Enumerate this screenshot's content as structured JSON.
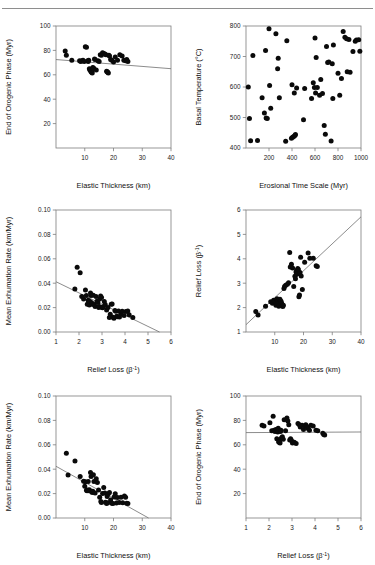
{
  "figure": {
    "title_ghost": "",
    "background": "#ffffff",
    "point_color": "#0a0a0a",
    "axis_color": "#7d7d7d",
    "trend_color": "#6e6e6e",
    "layout": "2 columns x 3 rows of scatter panels"
  },
  "chart_data": [
    {
      "id": "panel-top-left",
      "type": "scatter",
      "title": "",
      "xlabel": "Elastic Thickness (km)",
      "ylabel": "End of Orogenic Phase (Myr)",
      "xlim": [
        0,
        40
      ],
      "ylim": [
        0,
        100
      ],
      "xticks": [
        10,
        20,
        30,
        40
      ],
      "yticks": [
        20,
        40,
        60,
        80,
        100
      ],
      "grid": false,
      "legend": "none",
      "trendline": {
        "x": [
          0,
          40
        ],
        "y": [
          72.5,
          65.0
        ],
        "slope": -0.1875,
        "intercept": 72.5
      },
      "x": [
        3.2,
        3.6,
        5.5,
        8.2,
        8.6,
        9.0,
        9.4,
        9.8,
        10.2,
        10.6,
        11.0,
        11.2,
        11.4,
        11.6,
        11.8,
        12.0,
        12.2,
        12.4,
        12.6,
        12.8,
        13.0,
        13.2,
        13.4,
        13.6,
        14.0,
        14.6,
        15.0,
        15.4,
        15.8,
        16.2,
        16.6,
        17.0,
        17.4,
        17.6,
        17.8,
        18.0,
        18.2,
        18.4,
        18.6,
        19.0,
        19.4,
        20.0,
        20.6,
        21.4,
        22.2,
        23.0,
        23.6,
        24.2,
        24.6,
        25.0
      ],
      "y": [
        79.5,
        76.0,
        72.0,
        71.5,
        71.0,
        71.5,
        72.0,
        71.0,
        83.0,
        82.5,
        71.5,
        71.0,
        72.0,
        65.0,
        64.0,
        63.5,
        62.5,
        62.0,
        61.5,
        66.0,
        65.5,
        65.0,
        73.0,
        72.5,
        64.0,
        71.5,
        71.0,
        76.5,
        76.0,
        78.0,
        77.5,
        77.0,
        76.5,
        63.0,
        62.5,
        62.0,
        61.5,
        76.0,
        75.5,
        72.5,
        72.0,
        70.5,
        74.5,
        72.0,
        76.5,
        75.5,
        72.0,
        71.5,
        72.5,
        71.0
      ]
    },
    {
      "id": "panel-top-right",
      "type": "scatter",
      "title": "",
      "xlabel": "Erosional Time Scale (Myr)",
      "ylabel": "Basal Temperature (°C)",
      "xlim": [
        0,
        1000
      ],
      "ylim": [
        400,
        800
      ],
      "xticks": [
        200,
        400,
        600,
        800,
        1000
      ],
      "yticks": [
        400,
        500,
        600,
        700,
        800
      ],
      "grid": false,
      "legend": "none",
      "trendline": null,
      "x": [
        20,
        30,
        40,
        60,
        100,
        140,
        160,
        170,
        175,
        185,
        200,
        205,
        215,
        260,
        275,
        280,
        290,
        345,
        355,
        395,
        400,
        405,
        415,
        420,
        425,
        430,
        440,
        500,
        510,
        570,
        585,
        595,
        600,
        605,
        610,
        620,
        640,
        650,
        665,
        680,
        690,
        700,
        710,
        720,
        740,
        750,
        755,
        760,
        800,
        815,
        830,
        845,
        860,
        875,
        880,
        895,
        905,
        930,
        950,
        960,
        980,
        990
      ],
      "y": [
        600,
        497,
        424,
        703,
        425,
        565,
        515,
        720,
        498,
        497,
        791,
        605,
        530,
        775,
        660,
        694,
        565,
        422,
        752,
        432,
        607,
        435,
        438,
        580,
        441,
        444,
        597,
        493,
        595,
        562,
        614,
        598,
        761,
        580,
        697,
        598,
        573,
        625,
        579,
        474,
        445,
        733,
        680,
        682,
        423,
        676,
        562,
        738,
        645,
        573,
        628,
        782,
        763,
        758,
        650,
        756,
        648,
        716,
        750,
        754,
        755,
        717
      ]
    },
    {
      "id": "panel-middle-left",
      "type": "scatter",
      "title": "",
      "xlabel": "Relief Loss (β⁻¹)",
      "ylabel": "Mean Exhumation Rate (km/Myr)",
      "xlim": [
        1,
        6
      ],
      "ylim": [
        0.0,
        0.1
      ],
      "xticks": [
        1,
        2,
        3,
        4,
        5,
        6
      ],
      "yticks": [
        0.0,
        0.02,
        0.04,
        0.06,
        0.08,
        0.1
      ],
      "grid": false,
      "legend": "none",
      "trendline": {
        "x": [
          1,
          5.5
        ],
        "y": [
          0.0412,
          0.0
        ],
        "slope": -0.00916,
        "intercept": 0.0504
      },
      "x": [
        1.82,
        1.92,
        2.05,
        2.12,
        2.2,
        2.28,
        2.32,
        2.36,
        2.4,
        2.42,
        2.45,
        2.48,
        2.5,
        2.52,
        2.55,
        2.58,
        2.62,
        2.66,
        2.7,
        2.74,
        2.78,
        2.82,
        2.86,
        2.88,
        2.9,
        2.94,
        2.98,
        3.0,
        3.02,
        3.06,
        3.1,
        3.14,
        3.2,
        3.26,
        3.32,
        3.36,
        3.4,
        3.44,
        3.48,
        3.52,
        3.56,
        3.6,
        3.64,
        3.68,
        3.72,
        3.76,
        3.82,
        3.88,
        3.96,
        4.04,
        4.12,
        4.18,
        4.34
      ],
      "y": [
        0.0352,
        0.053,
        0.0485,
        0.029,
        0.027,
        0.0345,
        0.03,
        0.0228,
        0.026,
        0.024,
        0.0222,
        0.025,
        0.032,
        0.03,
        0.024,
        0.0228,
        0.0302,
        0.0225,
        0.0208,
        0.0292,
        0.0252,
        0.0242,
        0.02,
        0.021,
        0.027,
        0.0296,
        0.0282,
        0.0202,
        0.0198,
        0.0206,
        0.025,
        0.0226,
        0.018,
        0.02,
        0.0118,
        0.0146,
        0.0228,
        0.023,
        0.012,
        0.0112,
        0.0176,
        0.017,
        0.013,
        0.0126,
        0.0172,
        0.0122,
        0.0148,
        0.017,
        0.0136,
        0.0168,
        0.0172,
        0.0142,
        0.0118
      ]
    },
    {
      "id": "panel-middle-right",
      "type": "scatter",
      "title": "",
      "xlabel": "Elastic Thickness (km)",
      "ylabel": "Relief Loss (β⁻¹)",
      "xlim": [
        0,
        40
      ],
      "ylim": [
        1,
        6
      ],
      "xticks": [
        10,
        20,
        30,
        40
      ],
      "yticks": [
        1,
        2,
        3,
        4,
        5,
        6
      ],
      "grid": false,
      "legend": "none",
      "trendline": {
        "x": [
          0,
          40
        ],
        "y": [
          1.3,
          5.72
        ],
        "slope": 0.1105,
        "intercept": 1.3
      },
      "x": [
        3.4,
        4.2,
        6.8,
        8.6,
        9.2,
        9.6,
        10.0,
        10.4,
        10.6,
        10.8,
        11.0,
        11.2,
        11.4,
        11.6,
        11.8,
        12.0,
        12.2,
        12.4,
        12.6,
        12.8,
        13.0,
        13.2,
        13.4,
        13.8,
        14.4,
        14.8,
        15.2,
        15.4,
        15.8,
        16.2,
        16.6,
        17.0,
        17.2,
        17.4,
        17.6,
        17.8,
        18.0,
        18.2,
        18.4,
        18.6,
        18.8,
        19.0,
        19.2,
        19.6,
        20.4,
        21.6,
        22.2,
        23.4,
        24.4,
        24.8
      ],
      "y": [
        1.84,
        1.7,
        2.06,
        2.24,
        2.18,
        2.3,
        2.26,
        2.1,
        2.22,
        2.36,
        2.16,
        2.28,
        2.06,
        2.2,
        2.34,
        2.14,
        2.26,
        2.18,
        2.08,
        2.04,
        2.1,
        2.78,
        2.86,
        2.92,
        2.96,
        3.02,
        4.26,
        3.66,
        3.78,
        3.62,
        2.86,
        3.28,
        3.18,
        3.46,
        3.52,
        3.38,
        3.6,
        3.56,
        2.44,
        2.52,
        3.44,
        4.06,
        3.3,
        2.74,
        3.86,
        4.24,
        4.02,
        4.02,
        3.72,
        3.68
      ]
    },
    {
      "id": "panel-bottom-left",
      "type": "scatter",
      "title": "",
      "xlabel": "Elastic Thickness (km)",
      "ylabel": "Mean Exhumation Rate (km/Myr)",
      "xlim": [
        0,
        40
      ],
      "ylim": [
        0.0,
        0.1
      ],
      "xticks": [
        10,
        20,
        30,
        40
      ],
      "yticks": [
        0.0,
        0.02,
        0.04,
        0.06,
        0.08,
        0.1
      ],
      "grid": false,
      "legend": "none",
      "trendline": {
        "x": [
          0,
          32.2
        ],
        "y": [
          0.0424,
          0.0
        ],
        "slope": -0.001317,
        "intercept": 0.0424
      },
      "x": [
        3.6,
        4.2,
        6.6,
        8.4,
        9.6,
        10.0,
        10.2,
        10.6,
        10.8,
        11.0,
        11.2,
        11.4,
        11.6,
        11.8,
        12.0,
        12.2,
        12.6,
        12.8,
        13.0,
        13.2,
        13.6,
        14.0,
        14.4,
        14.8,
        15.2,
        15.6,
        15.8,
        16.2,
        16.6,
        17.0,
        17.2,
        17.6,
        17.8,
        18.0,
        18.2,
        18.6,
        19.0,
        19.4,
        19.8,
        20.2,
        20.6,
        21.0,
        21.4,
        22.0,
        22.6,
        23.2,
        23.8,
        24.2,
        24.6,
        25.0
      ],
      "y": [
        0.053,
        0.0352,
        0.0468,
        0.034,
        0.0302,
        0.026,
        0.0298,
        0.0228,
        0.0224,
        0.023,
        0.03,
        0.0226,
        0.0232,
        0.0222,
        0.0372,
        0.034,
        0.0208,
        0.022,
        0.0355,
        0.03,
        0.0204,
        0.0322,
        0.029,
        0.023,
        0.017,
        0.0136,
        0.0128,
        0.02,
        0.025,
        0.0204,
        0.013,
        0.0118,
        0.0176,
        0.0126,
        0.0198,
        0.0208,
        0.0148,
        0.012,
        0.0118,
        0.0172,
        0.0198,
        0.0122,
        0.0168,
        0.0128,
        0.017,
        0.0124,
        0.018,
        0.017,
        0.012,
        0.0118
      ]
    },
    {
      "id": "panel-bottom-right",
      "type": "scatter",
      "title": "",
      "xlabel": "Relief Loss (β⁻¹)",
      "ylabel": "End of Orogenic Phase (Myr)",
      "xlim": [
        1,
        6
      ],
      "ylim": [
        0,
        100
      ],
      "xticks": [
        1,
        2,
        3,
        4,
        5,
        6
      ],
      "yticks": [
        20,
        40,
        60,
        80,
        100
      ],
      "grid": false,
      "legend": "none",
      "trendline": {
        "x": [
          1,
          6
        ],
        "y": [
          70.0,
          70.5
        ],
        "slope": 0.1,
        "intercept": 69.9
      },
      "x": [
        1.7,
        1.78,
        2.04,
        2.12,
        2.18,
        2.22,
        2.26,
        2.3,
        2.34,
        2.36,
        2.38,
        2.4,
        2.42,
        2.44,
        2.46,
        2.48,
        2.5,
        2.52,
        2.54,
        2.58,
        2.62,
        2.66,
        2.72,
        2.78,
        2.82,
        2.86,
        2.9,
        2.94,
        2.98,
        3.02,
        3.1,
        3.18,
        3.26,
        3.32,
        3.36,
        3.44,
        3.5,
        3.56,
        3.6,
        3.64,
        3.68,
        3.72,
        3.76,
        3.82,
        3.92,
        4.04,
        4.12,
        4.34,
        4.38,
        4.42
      ],
      "y": [
        76.0,
        75.5,
        78.0,
        71.5,
        83.5,
        72.0,
        71.0,
        72.5,
        65.0,
        71.5,
        70.5,
        73.5,
        62.5,
        62.0,
        63.0,
        61.5,
        71.0,
        72.0,
        65.5,
        66.5,
        64.5,
        80.5,
        71.5,
        82.0,
        79.5,
        76.5,
        64.0,
        65.0,
        63.5,
        61.5,
        62.0,
        61.0,
        77.5,
        76.5,
        74.5,
        76.0,
        72.5,
        75.5,
        76.5,
        75.0,
        74.0,
        73.0,
        72.0,
        76.0,
        75.5,
        72.0,
        71.5,
        69.5,
        68.5,
        68.0
      ]
    }
  ]
}
